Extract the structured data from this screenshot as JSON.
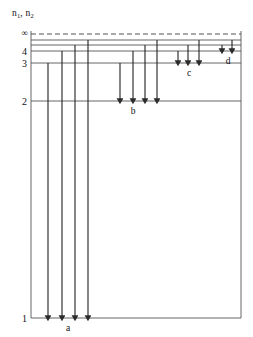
{
  "figure": {
    "kind": "energy-level-diagram",
    "background_color": "#ffffff",
    "line_color": "#555555",
    "arrow_color": "#2b2b2b",
    "text_color": "#111111",
    "frame": {
      "left": 31,
      "right": 241,
      "top": 31,
      "bottom": 318
    }
  },
  "axis": {
    "label": "n",
    "label_sub_1": "1",
    "label_sep": ", ",
    "label_2": "n",
    "label_sub_2": "2",
    "label_full": "n1, n2"
  },
  "levels": [
    {
      "name": "infinity",
      "tick": "∞",
      "y": 34,
      "style": "dashed",
      "line_from": 31,
      "line_to": 241
    },
    {
      "name": "level-upper-a",
      "tick": "",
      "y": 40,
      "style": "solid",
      "line_from": 31,
      "line_to": 241
    },
    {
      "name": "level-upper-b",
      "tick": "",
      "y": 45,
      "style": "solid",
      "line_from": 31,
      "line_to": 241
    },
    {
      "name": "level-4",
      "tick": "4",
      "y": 51,
      "style": "solid",
      "line_from": 31,
      "line_to": 241
    },
    {
      "name": "level-3",
      "tick": "3",
      "y": 63,
      "style": "solid",
      "line_from": 31,
      "line_to": 241
    },
    {
      "name": "level-2",
      "tick": "2",
      "y": 101,
      "style": "solid",
      "line_from": 31,
      "line_to": 241
    },
    {
      "name": "level-1",
      "tick": "1",
      "y": 318,
      "style": "solid",
      "line_from": 31,
      "line_to": 241
    }
  ],
  "transition_groups": [
    {
      "id": "a",
      "label": "a",
      "label_x": 68,
      "label_y": 331,
      "ends_at_level": "level-1",
      "end_y": 318,
      "arrows": [
        {
          "x": 48,
          "start_y": 63
        },
        {
          "x": 62,
          "start_y": 51
        },
        {
          "x": 75,
          "start_y": 45
        },
        {
          "x": 88,
          "start_y": 40
        }
      ]
    },
    {
      "id": "b",
      "label": "b",
      "label_x": 133,
      "label_y": 114,
      "ends_at_level": "level-2",
      "end_y": 101,
      "arrows": [
        {
          "x": 120,
          "start_y": 63
        },
        {
          "x": 133,
          "start_y": 51
        },
        {
          "x": 145,
          "start_y": 45
        },
        {
          "x": 157,
          "start_y": 40
        }
      ]
    },
    {
      "id": "c",
      "label": "c",
      "label_x": 189,
      "label_y": 76,
      "ends_at_level": "level-3",
      "end_y": 63,
      "arrows": [
        {
          "x": 178,
          "start_y": 51
        },
        {
          "x": 188,
          "start_y": 45
        },
        {
          "x": 199,
          "start_y": 40
        }
      ]
    },
    {
      "id": "d",
      "label": "d",
      "label_x": 228,
      "label_y": 64,
      "ends_at_level": "level-4",
      "end_y": 51,
      "arrows": [
        {
          "x": 222,
          "start_y": 45
        },
        {
          "x": 232,
          "start_y": 40
        }
      ]
    }
  ]
}
